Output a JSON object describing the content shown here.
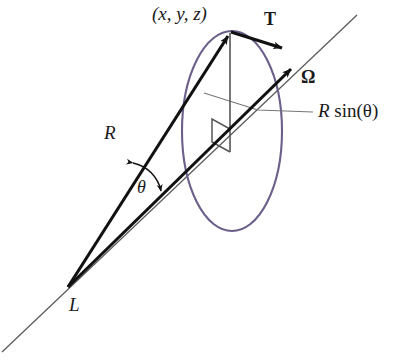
{
  "figure": {
    "kind": "geometry-diagram",
    "colors": {
      "circle_stroke": "#6b5f8a",
      "vector_stroke": "#111111",
      "axis_stroke": "#5a5a5a",
      "leader_stroke": "#777777",
      "text": "#1a1a1a",
      "background": "#ffffff"
    },
    "labels": {
      "point": "(x, y, z)",
      "tangential_vector": "T",
      "angular_velocity_vector": "Ω",
      "radius": "R",
      "angle": "θ",
      "perp_radius_prefix": "R",
      "perp_radius_fn": "sin",
      "perp_radius_arg": "(θ)",
      "perp_radius": "R sin(θ)",
      "pivot": "L"
    },
    "geometry": {
      "pivot": {
        "x": 68,
        "y": 287
      },
      "apex_point": {
        "x": 230,
        "y": 32
      },
      "circle": {
        "cx": 232,
        "cy": 131,
        "rx": 50,
        "ry": 100
      },
      "omega_arrow_tip": {
        "x": 293,
        "y": 67
      },
      "tangent_arrow_tip": {
        "x": 284,
        "y": 49
      },
      "foot_on_axis": {
        "x": 213,
        "y": 133
      }
    }
  }
}
